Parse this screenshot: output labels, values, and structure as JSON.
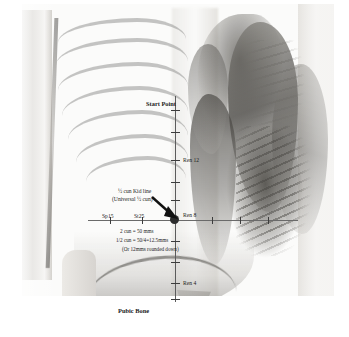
{
  "figure": {
    "title_label": "Start Point",
    "pubic_label": "Pubic Bone",
    "kid_line_label_1": "½ cun Kid line",
    "kid_line_label_2": "(Universal ½ cun)",
    "measurements": [
      "2 cun = 50 mms",
      "1/2 cun = 50/4=12.5mms",
      "(Or 12mms rounded down)"
    ],
    "points": [
      {
        "name": "ren-12",
        "label": "Ren 12"
      },
      {
        "name": "ren-8",
        "label": "Ren 8"
      },
      {
        "name": "ren-4",
        "label": "Ren 4"
      }
    ],
    "lateral_points": [
      {
        "name": "sp15",
        "label": "Sp15"
      },
      {
        "name": "st25",
        "label": "St25"
      }
    ],
    "colors": {
      "annotation_text": "#1b1b1b",
      "ruler_line": "#5b5b5b",
      "tick": "#3c3c3c",
      "node": "#2b2b2b",
      "plate_background": "#fbfbfa"
    }
  }
}
